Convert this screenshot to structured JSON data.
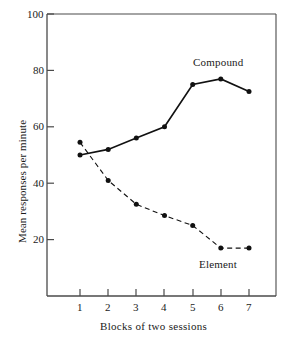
{
  "chart_data": {
    "type": "line",
    "title": "",
    "xlabel": "Blocks of two sessions",
    "ylabel": "Mean responses per minute",
    "x": [
      1,
      2,
      3,
      4,
      5,
      6,
      7
    ],
    "xticklabels": [
      "1",
      "2",
      "3",
      "4",
      "5",
      "6",
      "7"
    ],
    "yticks": [
      20,
      40,
      60,
      80,
      100
    ],
    "yticklabels": [
      "20",
      "40",
      "60",
      "80",
      "100"
    ],
    "ylim": [
      0,
      100
    ],
    "xlim": [
      0.35,
      7.7
    ],
    "grid": false,
    "legend": "inline-annotations",
    "series": [
      {
        "name": "Compound",
        "linestyle": "solid",
        "marker": "filled-circle",
        "color": "#111111",
        "values": [
          50,
          52,
          56,
          60,
          75,
          77,
          72.5
        ],
        "annotation": {
          "text": "Compound",
          "x": 5.6,
          "y": 86
        }
      },
      {
        "name": "Element",
        "linestyle": "dashed",
        "marker": "filled-circle",
        "color": "#111111",
        "values": [
          54.5,
          41,
          32.5,
          28.5,
          25,
          17,
          17
        ],
        "annotation": {
          "text": "Element",
          "x": 5.7,
          "y": 10
        }
      }
    ]
  },
  "axis": {
    "y_label": "Mean responses per minute",
    "x_label": "Blocks of two sessions",
    "y_tick_texts": [
      "100",
      "80",
      "60",
      "40",
      "20"
    ],
    "x_tick_texts": [
      "1",
      "2",
      "3",
      "4",
      "5",
      "6",
      "7"
    ]
  },
  "annotations": {
    "compound": "Compound",
    "element": "Element"
  },
  "colors": {
    "axis": "#4a4a4a",
    "line": "#111111",
    "text": "#1a1a1a",
    "background": "#ffffff"
  }
}
